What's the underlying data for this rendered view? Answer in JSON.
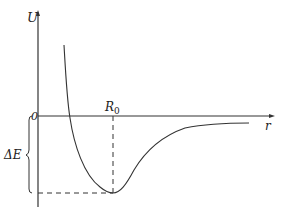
{
  "diagram": {
    "y_axis_label": "U",
    "x_axis_label": "r",
    "origin_label": "0",
    "equilibrium_label_base": "R",
    "equilibrium_label_sub": "0",
    "energy_gap_label": "ΔE",
    "colors": {
      "stroke": "#333333",
      "background": "#ffffff"
    }
  }
}
